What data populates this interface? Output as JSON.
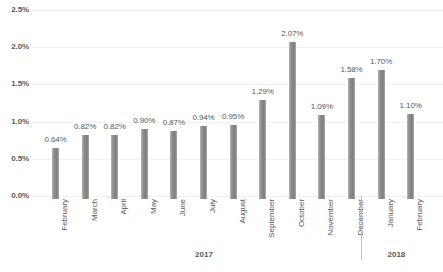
{
  "chart_data": {
    "type": "bar",
    "title": "",
    "subtitle": "",
    "xlabel": "",
    "ylabel": "",
    "ylim": [
      0.0,
      2.5
    ],
    "grid": true,
    "legend": null,
    "value_labels": true,
    "value_suffix": "%",
    "categories": [
      "February",
      "March",
      "April",
      "May",
      "June",
      "July",
      "August",
      "September",
      "October",
      "November",
      "December",
      "January",
      "February"
    ],
    "values": [
      0.64,
      0.82,
      0.82,
      0.9,
      0.87,
      0.94,
      0.95,
      1.29,
      2.07,
      1.09,
      1.58,
      1.7,
      1.1
    ],
    "data_labels": [
      "0.64%",
      "0.82%",
      "0.82%",
      "0.90%",
      "0.87%",
      "0.94%",
      "0.95%",
      "1.29%",
      "2.07%",
      "1.09%",
      "1.58%",
      "1.70%",
      "1.10%"
    ],
    "ytick_labels": [
      "0.0%",
      "0.5%",
      "1.0%",
      "1.5%",
      "2.0%",
      "2.5%"
    ],
    "ytick_values": [
      0.0,
      0.5,
      1.0,
      1.5,
      2.0,
      2.5
    ],
    "group_labels": [
      {
        "label": "2017",
        "from_index": 0,
        "to_index": 10
      },
      {
        "label": "2018",
        "from_index": 11,
        "to_index": 12
      }
    ],
    "colors": {
      "bar": "#808080",
      "bar_light_edge": "#bdbdbd",
      "gridline": "#f2f2f2",
      "text": "#595959",
      "separator": "#bfbfbf",
      "background": "#ffffff"
    }
  }
}
